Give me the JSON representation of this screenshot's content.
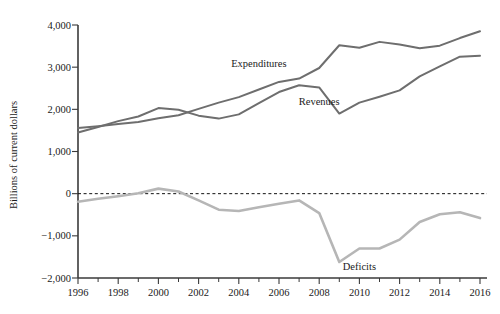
{
  "chart_data": {
    "type": "line",
    "title": "",
    "subtitle": "",
    "xlabel": "",
    "ylabel": "Billions of current dollars",
    "xlim": [
      1996,
      2016
    ],
    "ylim": [
      -2000,
      4000
    ],
    "grid": false,
    "legend_position": "inline-annotations",
    "x": [
      1996,
      1997,
      1998,
      1999,
      2000,
      2001,
      2002,
      2003,
      2004,
      2005,
      2006,
      2007,
      2008,
      2009,
      2010,
      2011,
      2012,
      2013,
      2014,
      2015,
      2016
    ],
    "xticks": [
      "1996",
      "1998",
      "2000",
      "2002",
      "2004",
      "2006",
      "2008",
      "2010",
      "2012",
      "2014",
      "2016"
    ],
    "yticks": [
      "4,000",
      "3,000",
      "2,000",
      "1,000",
      "0",
      "-1,000",
      "-2,000"
    ],
    "ytick_values": [
      4000,
      3000,
      2000,
      1000,
      0,
      -1000,
      -2000
    ],
    "zero_reference_line": true,
    "series": [
      {
        "name": "Expenditures",
        "color": "#6e6e6e",
        "label_x": 2005,
        "label_y": 3000,
        "values": [
          1560,
          1600,
          1650,
          1700,
          1790,
          1860,
          2010,
          2160,
          2290,
          2470,
          2650,
          2730,
          2980,
          3520,
          3460,
          3600,
          3540,
          3450,
          3510,
          3690,
          3850
        ]
      },
      {
        "name": "Revenues",
        "color": "#6e6e6e",
        "label_x": 2008,
        "label_y": 2100,
        "values": [
          1450,
          1580,
          1720,
          1830,
          2030,
          1990,
          1850,
          1780,
          1880,
          2150,
          2410,
          2570,
          2520,
          1900,
          2160,
          2300,
          2450,
          2780,
          3020,
          3250,
          3270
        ]
      },
      {
        "name": "Deficits",
        "color": "#b6b6b6",
        "label_x": 2010,
        "label_y": -1800,
        "values": [
          -190,
          -120,
          -60,
          10,
          120,
          50,
          -160,
          -380,
          -410,
          -320,
          -240,
          -160,
          -460,
          -1620,
          -1300,
          -1300,
          -1090,
          -670,
          -490,
          -440,
          -580
        ]
      }
    ]
  }
}
